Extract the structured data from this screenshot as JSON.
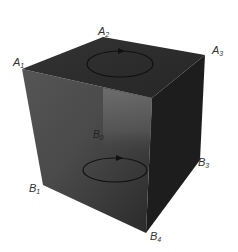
{
  "figure": {
    "type": "3d-cube-diagram",
    "colors": {
      "background": "#ffffff",
      "top_face": "#2e2e2e",
      "front_face_light": "#6a6a6a",
      "front_face_dark": "#2f2f2f",
      "right_face": "#1c1c1c",
      "loop_stroke": "#111111",
      "label": "#333333"
    },
    "labels": {
      "A1": {
        "base": "A",
        "sub": "1"
      },
      "A2": {
        "base": "A",
        "sub": "2"
      },
      "A3": {
        "base": "A",
        "sub": "3"
      },
      "B0": {
        "base": "B",
        "sub": "0"
      },
      "B1": {
        "base": "B",
        "sub": "1"
      },
      "B3": {
        "base": "B",
        "sub": "3"
      },
      "B4": {
        "base": "B",
        "sub": "4"
      }
    },
    "loops": [
      {
        "name": "top-loop",
        "direction": "clockwise-arrow"
      },
      {
        "name": "bottom-loop",
        "direction": "clockwise-arrow"
      }
    ]
  }
}
